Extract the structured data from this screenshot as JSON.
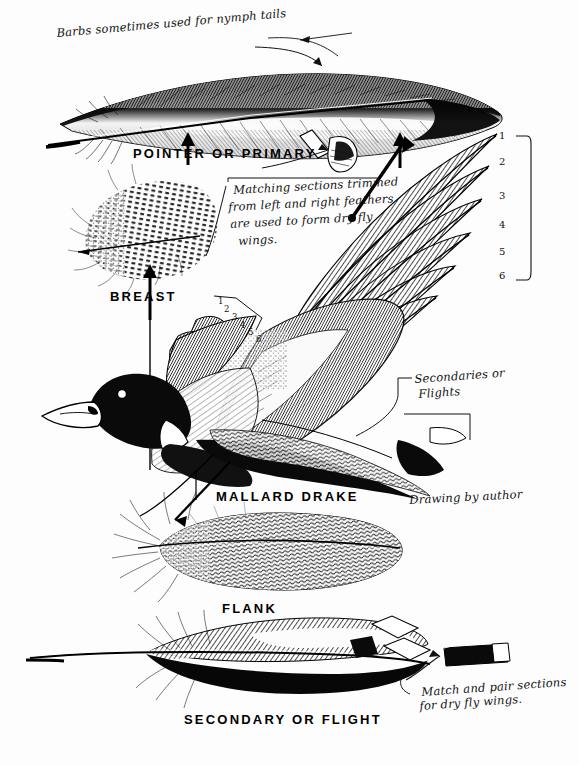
{
  "plate": {
    "background_color": "#fdfdfd",
    "ink_color": "#000000",
    "title_note": "Pen-and-ink fly-tying plate of mallard drake feathers"
  },
  "annotations": {
    "barbs_note": "Barbs sometimes used for nymph tails",
    "matching_note_line1": "Matching sections trimmed",
    "matching_note_line2": "from left and right feathers",
    "matching_note_line3": "are used to form dry fly",
    "matching_note_line4": "wings.",
    "secondaries_line1": "Secondaries or",
    "secondaries_line2": "Flights",
    "credit": "Drawing by author",
    "match_pair_line1": "Match and pair sections",
    "match_pair_line2": "for dry fly wings."
  },
  "labels": {
    "pointer_primary": "POINTER OR PRIMARY",
    "breast": "BREAST",
    "mallard_drake": "MALLARD DRAKE",
    "flank": "FLANK",
    "secondary_flight": "SECONDARY OR FLIGHT"
  },
  "wing_numbers_right": [
    "1",
    "2",
    "3",
    "4",
    "5",
    "6"
  ],
  "wing_numbers_small": [
    "1",
    "2",
    "3",
    "4",
    "5",
    "6"
  ],
  "icons": {
    "arrow_up": "arrow-up-icon",
    "arrow_diagonal": "arrow-diagonal-icon",
    "bracket": "bracket-icon",
    "leader_line": "leader-line-icon"
  }
}
